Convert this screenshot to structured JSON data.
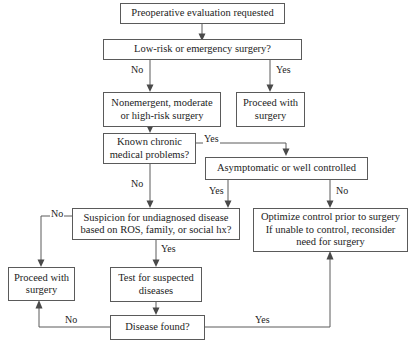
{
  "diagram": {
    "type": "flowchart",
    "line_color": "#5a5a5a",
    "text_color": "#1c1c1c",
    "background": "#ffffff",
    "nodes": [
      {
        "id": "preop",
        "label": "Preoperative evaluation requested"
      },
      {
        "id": "lowrisk",
        "label": "Low-risk or emergency surgery?"
      },
      {
        "id": "nonemergent",
        "line1": "Nonemergent, moderate",
        "line2": "or high-risk surgery"
      },
      {
        "id": "proceed_top",
        "line1": "Proceed with",
        "line2": "surgery"
      },
      {
        "id": "chronic",
        "line1": "Known chronic",
        "line2": "medical problems?"
      },
      {
        "id": "asymptomatic",
        "label": "Asymptomatic or well controlled"
      },
      {
        "id": "suspicion",
        "line1": "Suspicion for undiagnosed disease",
        "line2": "based on ROS, family, or social hx?"
      },
      {
        "id": "optimize",
        "line1": "Optimize control prior to surgery",
        "line2": "If unable to control, reconsider",
        "line3": "need for surgery"
      },
      {
        "id": "proceed_left",
        "line1": "Proceed with",
        "line2": "surgery"
      },
      {
        "id": "test",
        "line1": "Test for suspected",
        "line2": "diseases"
      },
      {
        "id": "disease",
        "label": "Disease found?"
      }
    ],
    "edge_labels": {
      "lowrisk_no": "No",
      "lowrisk_yes": "Yes",
      "chronic_yes": "Yes",
      "chronic_no": "No",
      "asymptomatic_yes": "Yes",
      "asymptomatic_no": "No",
      "suspicion_no": "No",
      "suspicion_yes": "Yes",
      "disease_no": "No",
      "disease_yes": "Yes"
    }
  }
}
